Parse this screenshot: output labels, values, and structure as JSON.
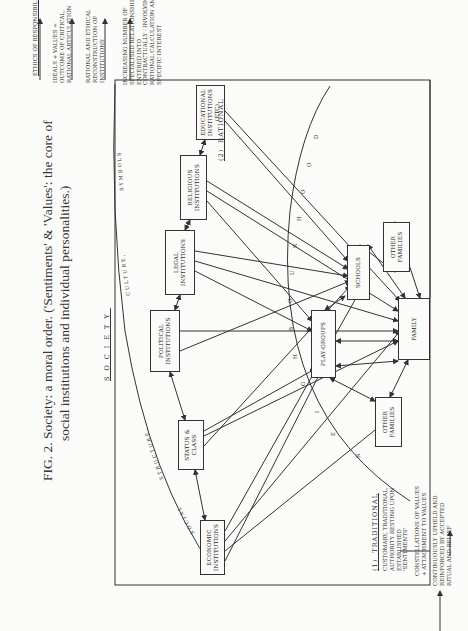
{
  "figure": {
    "caption_line1": "FIG. 2. Society: a moral order. ('Sentiments' & 'Values': the core of",
    "caption_line2": "social institutions and individual personalities.)",
    "society_label": "SOCIETY"
  },
  "arc_labels": {
    "social_structure": [
      "SOCIAL",
      "STRUCTURE,"
    ],
    "culture_symbols": [
      "CULTURE,",
      "SYMBOLS"
    ],
    "neighbourhood": [
      "N",
      "E",
      "I",
      "G",
      "H",
      "B",
      "O",
      "U",
      "R",
      "H",
      "O",
      "O",
      "D"
    ]
  },
  "institutions": {
    "economic": "ECONOMIC INSTITUTIONS",
    "status_class": "STATUS & CLASS",
    "political": "POLITICAL INSTITUTIONS",
    "legal": "LEGAL INSTITUTIONS",
    "religious": "RELIGIOUS INSTITUTIONS",
    "educational": "EDUCATIONAL INSTITUTIONS (ETC)",
    "play_groups": "PLAY-GROUPS",
    "schools": "SCHOOLS",
    "other_families_a": "OTHER FAMILIES",
    "other_families_b": "OTHER FAMILIES",
    "family": "FAMILY"
  },
  "traditional": {
    "heading": "(1)  TRADITIONAL",
    "desc": "CUSTOMARY, TRADITIONAL,\nAUTHORITY RESTING UPON\nESTABLISHED\n'SENTIMENTS'",
    "constellation": "CONSTELLATIONS OF VALUES\n+ ATTACHMENT TO VALUES",
    "upheld": "CONTINUOUSLY UPHELD AND\nREINFORCED BY ACCEPTED\nRITUAL AND BELIEF"
  },
  "rational": {
    "heading": "(2)  RATIONAL",
    "desc": "INCREASING NUMBER OF\nSPECIALISED RELATIONSHIPS\nENTERED INTO\nCONTRACTUALLY - INVOLVING\nRATIONAL CALCULATION AND\nSPECIFIC INTEREST",
    "reconstruction": "RATIONAL AND ETHICAL\nRECONSTRUCTION OF\nINSTITUTIONS",
    "ideals": "IDEALS + VALUES =\nOUTCOME OF CRITICAL,\nRATIONAL ARTICULATION",
    "ethics": "ETHICS OF RESPONSIBILITY"
  }
}
